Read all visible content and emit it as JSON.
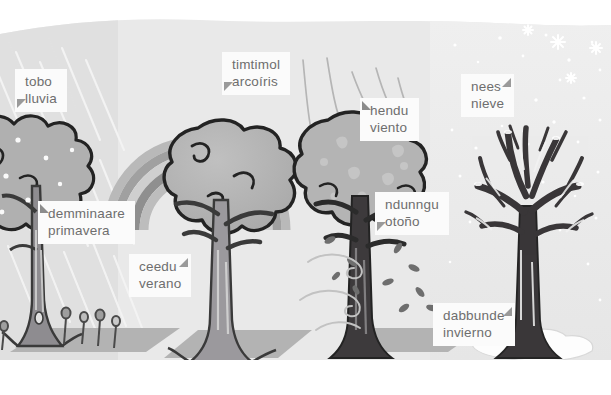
{
  "illustration": {
    "title": "Las cuatro estaciones",
    "theme_colors": {
      "panel_bg": "#e9e9e9",
      "label_bg": "#fbfbfb",
      "label_text": "#6e6e6e",
      "tree_outline": "#232323",
      "foliage": "#b3b3b3",
      "trunk": "#8e8c90",
      "ground": "#b0b0b0",
      "snow": "#fdfdfd"
    }
  },
  "labels": [
    {
      "id": "rain",
      "native": "tobo",
      "spanish": "lluvia",
      "pointer": "bottom-left"
    },
    {
      "id": "rainbow",
      "native": "timtimol",
      "spanish": "arcoíris",
      "pointer": "bottom-left"
    },
    {
      "id": "wind",
      "native": "hendu",
      "spanish": "viento",
      "pointer": "top-left"
    },
    {
      "id": "snow",
      "native": "nees",
      "spanish": "nieve",
      "pointer": "top-right"
    },
    {
      "id": "spring",
      "native": "demminaare",
      "spanish": "primavera",
      "pointer": "top-left"
    },
    {
      "id": "summer",
      "native": "ceedu",
      "spanish": "verano",
      "pointer": "top-right"
    },
    {
      "id": "autumn",
      "native": "ndunngu",
      "spanish": "otoño",
      "pointer": "bottom-left"
    },
    {
      "id": "winter",
      "native": "dabbunde",
      "spanish": "invierno",
      "pointer": "top-right"
    }
  ],
  "scenes": [
    {
      "id": "spring",
      "weather": "rain",
      "tree": "leafy-rainy",
      "ground": "grass-patch-with-flowers"
    },
    {
      "id": "summer",
      "weather": "rainbow",
      "tree": "full-foliage",
      "ground": "grass-patch"
    },
    {
      "id": "autumn",
      "weather": "wind",
      "tree": "falling-leaves",
      "ground": "grass-patch"
    },
    {
      "id": "winter",
      "weather": "snow",
      "tree": "bare-branches",
      "ground": "snow-patch"
    }
  ]
}
